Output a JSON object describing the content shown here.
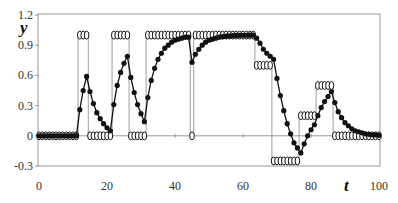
{
  "chart_data": {
    "type": "line",
    "title": "",
    "xlabel": "t",
    "ylabel": "y",
    "xlim": [
      0,
      100
    ],
    "ylim": [
      -0.3,
      1.2
    ],
    "x_ticks": [
      "0",
      "20",
      "40",
      "60",
      "80",
      "100"
    ],
    "y_ticks": [
      "-0.3",
      "0",
      "0.3",
      "0.6",
      "0.9",
      "1.2"
    ],
    "grid": false,
    "legend": "none",
    "series": [
      {
        "name": "input u (open circles, step)",
        "style": "step-open-circles",
        "segments": [
          {
            "t_start": 0,
            "t_end": 11,
            "value": 0
          },
          {
            "t_start": 12,
            "t_end": 14,
            "value": 1
          },
          {
            "t_start": 15,
            "t_end": 21,
            "value": 0
          },
          {
            "t_start": 22,
            "t_end": 26,
            "value": 1
          },
          {
            "t_start": 27,
            "t_end": 31,
            "value": 0
          },
          {
            "t_start": 32,
            "t_end": 44,
            "value": 1
          },
          {
            "t_start": 45,
            "t_end": 45,
            "value": 0
          },
          {
            "t_start": 46,
            "t_end": 63,
            "value": 1
          },
          {
            "t_start": 64,
            "t_end": 68,
            "value": 0.7
          },
          {
            "t_start": 69,
            "t_end": 76,
            "value": -0.25
          },
          {
            "t_start": 77,
            "t_end": 81,
            "value": 0.2
          },
          {
            "t_start": 82,
            "t_end": 86,
            "value": 0.5
          },
          {
            "t_start": 87,
            "t_end": 100,
            "value": 0
          }
        ]
      },
      {
        "name": "output y (filled dots)",
        "style": "line-filled-dots",
        "x": [
          0,
          1,
          2,
          3,
          4,
          5,
          6,
          7,
          8,
          9,
          10,
          11,
          12,
          13,
          14,
          15,
          16,
          17,
          18,
          19,
          20,
          21,
          22,
          23,
          24,
          25,
          26,
          27,
          28,
          29,
          30,
          31,
          32,
          33,
          34,
          35,
          36,
          37,
          38,
          39,
          40,
          41,
          42,
          43,
          44,
          45,
          46,
          47,
          48,
          49,
          50,
          51,
          52,
          53,
          54,
          55,
          56,
          57,
          58,
          59,
          60,
          61,
          62,
          63,
          64,
          65,
          66,
          67,
          68,
          69,
          70,
          71,
          72,
          73,
          74,
          75,
          76,
          77,
          78,
          79,
          80,
          81,
          82,
          83,
          84,
          85,
          86,
          87,
          88,
          89,
          90,
          91,
          92,
          93,
          94,
          95,
          96,
          97,
          98,
          99,
          100
        ],
        "values": [
          0,
          0,
          0,
          0,
          0,
          0,
          0,
          0,
          0,
          0,
          0,
          0,
          0.26,
          0.45,
          0.59,
          0.44,
          0.32,
          0.23,
          0.17,
          0.12,
          0.08,
          0.05,
          0.31,
          0.5,
          0.63,
          0.72,
          0.79,
          0.58,
          0.43,
          0.31,
          0.22,
          0.14,
          0.38,
          0.55,
          0.67,
          0.76,
          0.82,
          0.87,
          0.9,
          0.93,
          0.95,
          0.96,
          0.97,
          0.98,
          0.98,
          0.73,
          0.81,
          0.86,
          0.9,
          0.93,
          0.95,
          0.96,
          0.97,
          0.98,
          0.985,
          0.99,
          0.993,
          0.995,
          0.997,
          0.998,
          0.999,
          0.999,
          1.0,
          1.0,
          0.97,
          0.92,
          0.86,
          0.82,
          0.79,
          0.76,
          0.57,
          0.4,
          0.25,
          0.12,
          0.02,
          -0.07,
          -0.12,
          -0.17,
          -0.08,
          0.0,
          0.06,
          0.11,
          0.2,
          0.28,
          0.34,
          0.39,
          0.44,
          0.33,
          0.24,
          0.18,
          0.13,
          0.1,
          0.07,
          0.05,
          0.04,
          0.03,
          0.02,
          0.015,
          0.01,
          0.008,
          0.005
        ]
      }
    ]
  }
}
